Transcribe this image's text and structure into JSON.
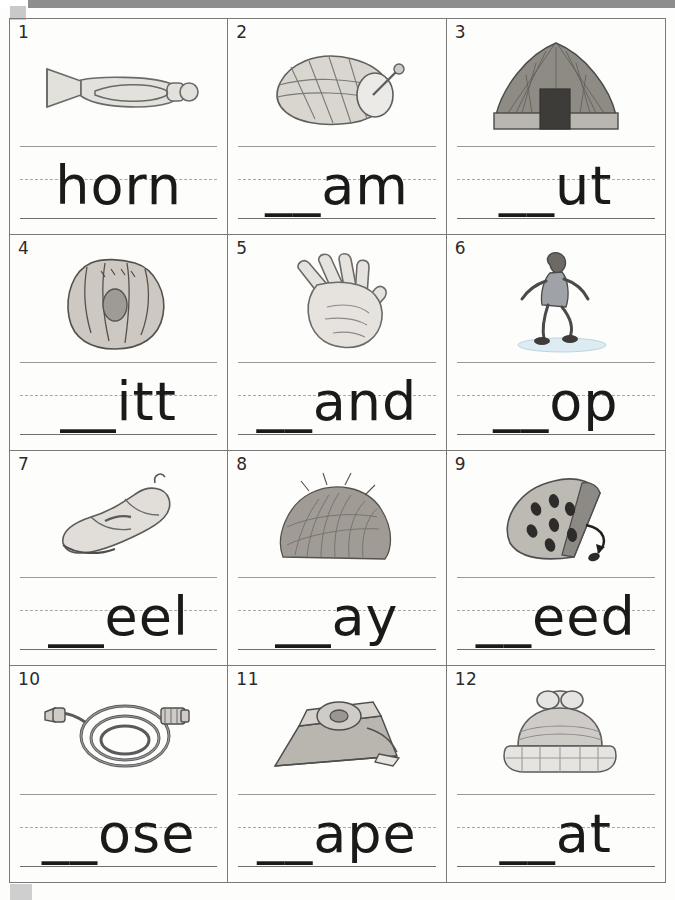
{
  "page": {
    "columns": 3,
    "rows": 4
  },
  "items": [
    {
      "number": "1",
      "word": "horn",
      "picture": "horn-icon",
      "picture_label": "bugle horn"
    },
    {
      "number": "2",
      "word": "__am",
      "picture": "ham-icon",
      "picture_label": "ham"
    },
    {
      "number": "3",
      "word": "__ut",
      "picture": "hut-icon",
      "picture_label": "hut"
    },
    {
      "number": "4",
      "word": "__itt",
      "picture": "mitt-icon",
      "picture_label": "baseball mitt"
    },
    {
      "number": "5",
      "word": "__and",
      "picture": "hand-icon",
      "picture_label": "hand"
    },
    {
      "number": "6",
      "word": "__op",
      "picture": "hop-icon",
      "picture_label": "child hopping"
    },
    {
      "number": "7",
      "word": "__eel",
      "picture": "heel-icon",
      "picture_label": "heel shoe"
    },
    {
      "number": "8",
      "word": "__ay",
      "picture": "hay-icon",
      "picture_label": "hay bale"
    },
    {
      "number": "9",
      "word": "__eed",
      "picture": "seed-icon",
      "picture_label": "watermelon seed"
    },
    {
      "number": "10",
      "word": "__ose",
      "picture": "hose-icon",
      "picture_label": "garden hose"
    },
    {
      "number": "11",
      "word": "__ape",
      "picture": "tape-icon",
      "picture_label": "tape dispenser"
    },
    {
      "number": "12",
      "word": "__at",
      "picture": "hat-icon",
      "picture_label": "knit hat"
    }
  ],
  "colors": {
    "ink": "#1a1a1a",
    "rule_line": "#9a9a9a",
    "baseline": "#6f6f6f",
    "border": "#7a7a7a",
    "art_fill": "#d6d3cd",
    "art_stroke": "#6a6a6a",
    "paper": "#fdfdfb"
  }
}
